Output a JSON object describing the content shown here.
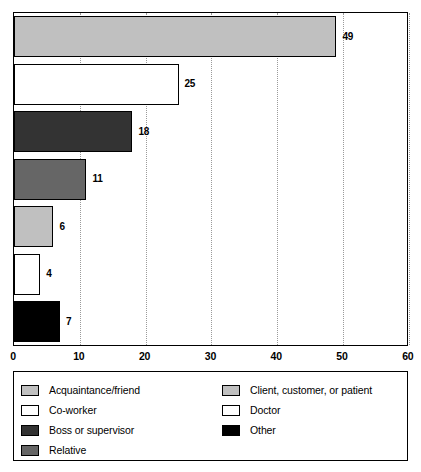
{
  "chart_data": {
    "type": "bar",
    "orientation": "horizontal",
    "title": "",
    "subtitle": "",
    "xlabel": "",
    "ylabel": "",
    "xlim": [
      0,
      60
    ],
    "grid": true,
    "grid_axis": "x",
    "legend_position": "bottom",
    "xticks": [
      "0",
      "10",
      "20",
      "30",
      "40",
      "50",
      "60"
    ],
    "xtick_values": [
      0,
      10,
      20,
      30,
      40,
      50,
      60
    ],
    "categories": [
      "Acquaintance/friend",
      "Co-worker",
      "Boss or supervisor",
      "Relative",
      "Client, customer, or patient",
      "Doctor",
      "Other"
    ],
    "values": [
      49,
      25,
      18,
      11,
      6,
      4,
      7
    ],
    "value_labels": [
      "49",
      "25",
      "18",
      "11",
      "6",
      "4",
      "7"
    ],
    "colors": [
      "#c0c0c0",
      "#ffffff",
      "#333333",
      "#666666",
      "#c0c0c0",
      "#ffffff",
      "#000000"
    ],
    "bar_edge_color": "#000000",
    "bars": [
      {
        "category": "Acquaintance/friend",
        "value": 49,
        "label": "49",
        "color": "#c0c0c0"
      },
      {
        "category": "Co-worker",
        "value": 25,
        "label": "25",
        "color": "#ffffff"
      },
      {
        "category": "Boss or supervisor",
        "value": 18,
        "label": "18",
        "color": "#333333"
      },
      {
        "category": "Relative",
        "value": 11,
        "label": "11",
        "color": "#666666"
      },
      {
        "category": "Client, customer, or patient",
        "value": 6,
        "label": "6",
        "color": "#c0c0c0"
      },
      {
        "category": "Doctor",
        "value": 4,
        "label": "4",
        "color": "#ffffff"
      },
      {
        "category": "Other",
        "value": 7,
        "label": "7",
        "color": "#000000"
      }
    ]
  },
  "legend": {
    "left_column": [
      {
        "label": "Acquaintance/friend",
        "color": "#c0c0c0"
      },
      {
        "label": "Co-worker",
        "color": "#ffffff"
      },
      {
        "label": "Boss or supervisor",
        "color": "#333333"
      },
      {
        "label": "Relative",
        "color": "#666666"
      }
    ],
    "right_column": [
      {
        "label": "Client, customer, or patient",
        "color": "#c0c0c0"
      },
      {
        "label": "Doctor",
        "color": "#ffffff"
      },
      {
        "label": "Other",
        "color": "#000000"
      }
    ]
  },
  "axis": {
    "tick_labels": [
      "0",
      "10",
      "20",
      "30",
      "40",
      "50",
      "60"
    ]
  }
}
